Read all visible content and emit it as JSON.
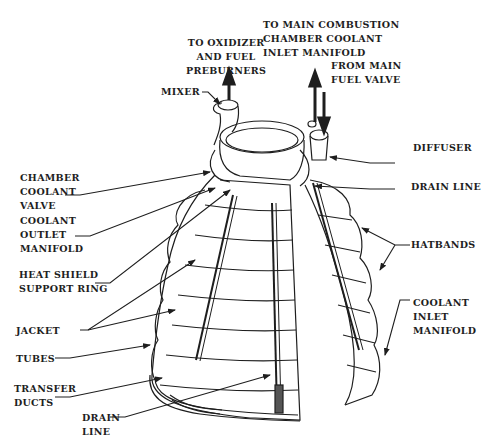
{
  "diagram": {
    "colors": {
      "ink": "#1e1e1e",
      "background": "#ffffff"
    },
    "labels": {
      "to_oxidizer": "TO OXIDIZER\nAND FUEL\nPREBURNERS",
      "to_main_combustion": "TO MAIN COMBUSTION\nCHAMBER COOLANT\nINLET MANIFOLD",
      "from_main_fuel_valve": "FROM MAIN\nFUEL VALVE",
      "mixer": "MIXER",
      "diffuser": "DIFFUSER",
      "chamber_coolant_valve": "CHAMBER\nCOOLANT\nVALVE",
      "drain_line_right": "DRAIN LINE",
      "coolant_outlet_manifold": "COOLANT\nOUTLET\nMANIFOLD",
      "hatbands": "HATBANDS",
      "heat_shield_support_ring": "HEAT SHIELD\nSUPPORT RING",
      "coolant_inlet_manifold": "COOLANT\nINLET\nMANIFOLD",
      "jacket": "JACKET",
      "tubes": "TUBES",
      "transfer_ducts": "TRANSFER\nDUCTS",
      "drain_line_bottom": "DRAIN\nLINE"
    }
  }
}
